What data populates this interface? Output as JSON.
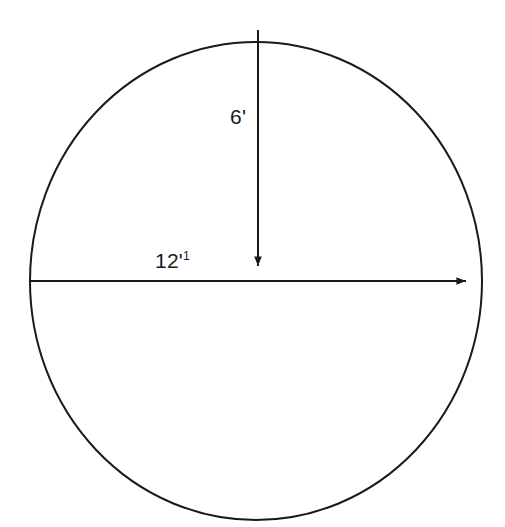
{
  "figure": {
    "kind": "geometry-diagram",
    "shape": "circle",
    "background_color": "#ffffff",
    "stroke_color": "#1a1a1a",
    "text_color": "#1a1a1a",
    "stroke_width": 2,
    "circle": {
      "center_x": 256,
      "center_y": 281,
      "radius_x": 226,
      "radius_y": 239,
      "filled": false
    },
    "annotations": [
      {
        "name": "diameter",
        "label": "12'",
        "label_superscript": "1",
        "arrow": "single-headed-right",
        "from_x": 30,
        "from_y": 281,
        "to_x": 481,
        "to_y": 281,
        "orientation": "horizontal",
        "label_x": 155,
        "label_y": 250
      },
      {
        "name": "radius",
        "label": "6'",
        "label_superscript": "",
        "arrow": "single-headed-down",
        "from_x": 258,
        "from_y": 30,
        "to_x": 258,
        "to_y": 281,
        "orientation": "vertical",
        "label_x": 230,
        "label_y": 106
      }
    ]
  },
  "chart_data": {
    "type": "diagram",
    "title": "",
    "shape": "circle",
    "measurements": [
      {
        "name": "diameter",
        "value": 12,
        "unit": "'",
        "display": "12'"
      },
      {
        "name": "radius",
        "value": 6,
        "unit": "'",
        "display": "6'"
      }
    ]
  }
}
